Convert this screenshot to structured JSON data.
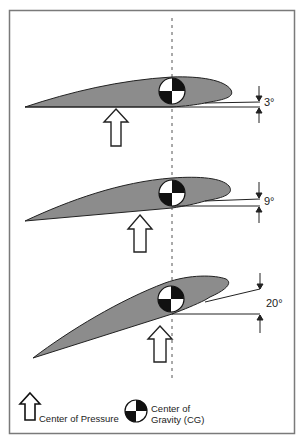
{
  "diagram": {
    "colors": {
      "frame": "#7a7a7a",
      "airfoil_fill": "#8c8c8c",
      "outline": "#222222",
      "cg_dark": "#111111",
      "cg_light": "#ffffff"
    },
    "panels": [
      {
        "angle_label": "3°",
        "angle_deg": 3
      },
      {
        "angle_label": "9°",
        "angle_deg": 9
      },
      {
        "angle_label": "20°",
        "angle_deg": 20
      }
    ],
    "legend": {
      "center_of_pressure": "Center of Pressure",
      "cg_line1": "Center of",
      "cg_line2": "Gravity (CG)"
    },
    "icons": {
      "pressure": "up-arrow-outline-icon",
      "cg": "center-of-gravity-icon"
    }
  }
}
